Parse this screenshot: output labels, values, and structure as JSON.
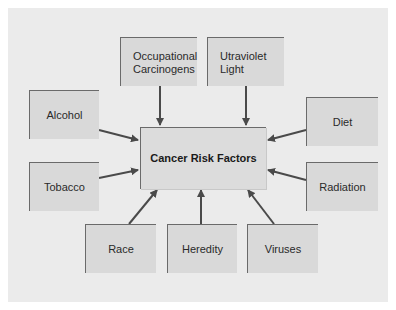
{
  "diagram": {
    "title": "Cancer Risk Factors",
    "center": {
      "label": "Cancer Risk Factors"
    },
    "factors": [
      {
        "id": "occupational",
        "lines": [
          "Occupational",
          "Carcinogens"
        ]
      },
      {
        "id": "ultraviolet",
        "lines": [
          "Utraviolet",
          "Light"
        ]
      },
      {
        "id": "alcohol",
        "label": "Alcohol"
      },
      {
        "id": "diet",
        "label": "Diet"
      },
      {
        "id": "tobacco",
        "label": "Tobacco"
      },
      {
        "id": "radiation",
        "label": "Radiation"
      },
      {
        "id": "race",
        "label": "Race"
      },
      {
        "id": "heredity",
        "label": "Heredity"
      },
      {
        "id": "viruses",
        "label": "Viruses"
      }
    ],
    "colors": {
      "panel": "#ebebeb",
      "box": "#d9d9d9",
      "box_edge": "#6a6a6a",
      "arrow": "#4a4a4a"
    }
  }
}
